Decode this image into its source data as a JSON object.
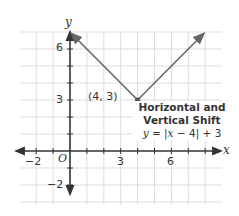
{
  "chart_data": {
    "type": "line",
    "title": "Horizontal and Vertical Shift",
    "equation": "y = |x − 4| + 3",
    "equation_parts": {
      "var": "y",
      "rest_pre": " = |",
      "x": "x",
      "rest_post": " − 4| + 3"
    },
    "xlabel": "x",
    "ylabel": "y",
    "origin_label": "O",
    "xlim": [
      -3,
      9
    ],
    "ylim": [
      -3,
      7
    ],
    "x_ticks": [
      -2,
      -1,
      1,
      2,
      3,
      4,
      5,
      6,
      7,
      8
    ],
    "y_ticks": [
      -2,
      -1,
      1,
      2,
      3,
      4,
      5,
      6
    ],
    "x_tick_labels": [
      {
        "value": -2,
        "text": "−2"
      },
      {
        "value": 3,
        "text": "3"
      },
      {
        "value": 6,
        "text": "6"
      }
    ],
    "y_tick_labels": [
      {
        "value": 6,
        "text": "6"
      },
      {
        "value": 3,
        "text": "3"
      },
      {
        "value": -2,
        "text": "−2"
      }
    ],
    "grid": true,
    "series": [
      {
        "name": "y = |x − 4| + 3",
        "x": [
          0.1,
          4,
          7.9
        ],
        "y": [
          6.9,
          3,
          6.9
        ],
        "arrows_at_ends": true,
        "color": "#666666"
      }
    ],
    "annotations": [
      {
        "type": "point",
        "x": 4,
        "y": 3,
        "text": "(4, 3)"
      }
    ]
  },
  "colors": {
    "grid": "#dddddd",
    "axis": "#333333",
    "curve": "#666666",
    "point": "#555555",
    "text": "#333333"
  },
  "labels": {
    "annotation_title_line1": "Horizontal and",
    "annotation_title_line2": "Vertical Shift",
    "vertex_label": "(4, 3)"
  }
}
